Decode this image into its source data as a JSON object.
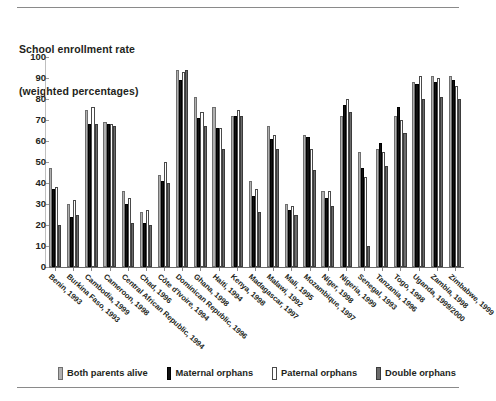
{
  "title": {
    "line1": "School enrollment rate",
    "line2": "(weighted percentages)"
  },
  "legend": {
    "items": [
      {
        "label": "Both parents alive",
        "color": "#b0b0b0"
      },
      {
        "label": "Maternal orphans",
        "color": "#111111"
      },
      {
        "label": "Paternal orphans",
        "color": "#ffffff"
      },
      {
        "label": "Double orphans",
        "color": "#6b6b6b"
      }
    ]
  },
  "chart_data": {
    "type": "bar",
    "title": "School enrollment rate (weighted percentages)",
    "xlabel": "",
    "ylabel": "",
    "ylim": [
      0,
      100
    ],
    "yticks": [
      0,
      10,
      20,
      30,
      40,
      50,
      60,
      70,
      80,
      90,
      100
    ],
    "grid": false,
    "legend_position": "bottom",
    "categories": [
      "Benin, 1993",
      "Burkina Faso, 1993",
      "Cambodia, 1999",
      "Cameroon, 1998",
      "Central African Republic, 1994",
      "Chad, 1996",
      "Côte d'Ivoire, 1994",
      "Dominican Republic, 1996",
      "Ghana, 1998",
      "Haiti, 1994",
      "Kenya, 1998",
      "Madagascar, 1997",
      "Malawi, 1992",
      "Mali, 1995",
      "Mozambique, 1997",
      "Niger, 1998",
      "Nigeria, 1999",
      "Senegal, 1993",
      "Tanzania, 1996",
      "Togo, 1998",
      "Uganda, 1999/2000",
      "Zambia, 1998",
      "Zimbabwe, 1999"
    ],
    "series": [
      {
        "name": "Both parents alive",
        "color": "#b0b0b0",
        "values": [
          47,
          30,
          75,
          69,
          36,
          26,
          44,
          94,
          81,
          76,
          72,
          41,
          67,
          30,
          63,
          36,
          72,
          55,
          56,
          72,
          88,
          91,
          91
        ]
      },
      {
        "name": "Maternal orphans",
        "color": "#111111",
        "values": [
          37,
          24,
          68,
          68,
          30,
          21,
          41,
          89,
          71,
          66,
          72,
          34,
          61,
          27,
          62,
          33,
          77,
          47,
          59,
          76,
          87,
          88,
          89
        ]
      },
      {
        "name": "Paternal orphans",
        "color": "#ffffff",
        "values": [
          38,
          32,
          76,
          68,
          33,
          27,
          50,
          93,
          74,
          66,
          75,
          37,
          63,
          29,
          56,
          36,
          80,
          43,
          55,
          70,
          91,
          90,
          86
        ]
      },
      {
        "name": "Double orphans",
        "color": "#6b6b6b",
        "values": [
          20,
          25,
          68,
          67,
          21,
          20,
          40,
          94,
          67,
          56,
          72,
          26,
          56,
          25,
          46,
          29,
          74,
          10,
          48,
          64,
          80,
          81,
          80
        ]
      }
    ]
  }
}
